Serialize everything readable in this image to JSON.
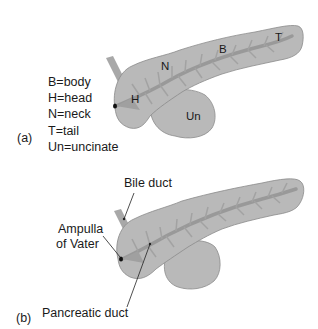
{
  "colors": {
    "organ_fill": "#b9b9b9",
    "organ_stroke": "#8a8a8a",
    "duct": "#999999",
    "text": "#1a1a1a"
  },
  "panel_a": {
    "label": "(a)",
    "region_labels": {
      "neck": "N",
      "body": "B",
      "tail": "T",
      "head": "H",
      "uncinate": "Un"
    },
    "legend": [
      "B=body",
      "H=head",
      "N=neck",
      "T=tail",
      "Un=uncinate"
    ]
  },
  "panel_b": {
    "label": "(b)",
    "callouts": {
      "bile_duct": "Bile duct",
      "ampulla_line1": "Ampulla",
      "ampulla_line2": "of Vater",
      "pancreatic_duct": "Pancreatic duct"
    }
  }
}
